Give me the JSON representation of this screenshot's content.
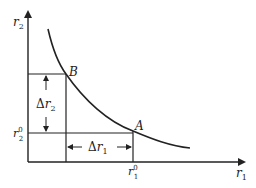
{
  "diagram": {
    "axes": {
      "x_label": "r",
      "x_label_sub": "1",
      "y_label": "r",
      "y_label_sub": "2"
    },
    "points": {
      "A": "A",
      "B": "B"
    },
    "ticks": {
      "x_tick_base": "r",
      "x_tick_sub": "1",
      "x_tick_sup": "0",
      "y_tick_base": "r",
      "y_tick_sub": "2",
      "y_tick_sup": "0"
    },
    "deltas": {
      "delta_r2_symbol": "Δ",
      "delta_r2_var": "r",
      "delta_r2_sub": "2",
      "delta_r1_symbol": "Δ",
      "delta_r1_var": "r",
      "delta_r1_sub": "1"
    },
    "colors": {
      "stroke": "#222222",
      "background": "#ffffff"
    }
  }
}
